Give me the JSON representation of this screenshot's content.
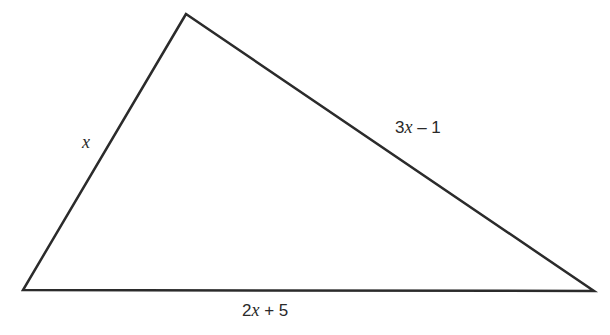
{
  "diagram": {
    "type": "triangle",
    "stroke_color": "#2b2b2b",
    "stroke_width": 2.5,
    "vertices": {
      "top": [
        186,
        14
      ],
      "bottom_left": [
        23,
        290
      ],
      "bottom_right": [
        594,
        291
      ]
    },
    "side_labels": {
      "left": {
        "parts": [
          "",
          "x",
          ""
        ]
      },
      "right": {
        "parts": [
          "3",
          "x",
          " – 1"
        ]
      },
      "bottom": {
        "parts": [
          "2",
          "x",
          " + 5"
        ]
      }
    }
  }
}
